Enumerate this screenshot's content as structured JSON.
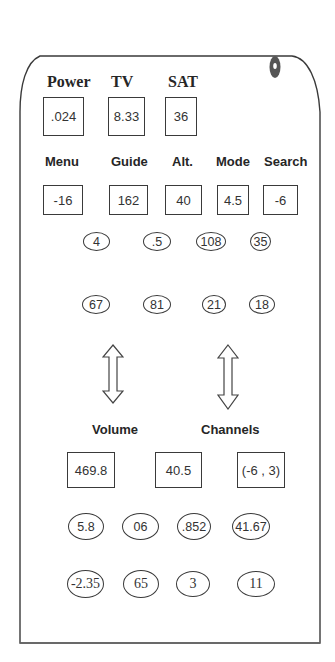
{
  "remote": {
    "top_labels": [
      "Power",
      "TV",
      "SAT"
    ],
    "top_values": [
      ".024",
      "8.33",
      "36"
    ],
    "mid_labels": [
      "Menu",
      "Guide",
      "Alt.",
      "Mode",
      "Search"
    ],
    "mid_values": [
      "-16",
      "162",
      "40",
      "4.5",
      "-6"
    ],
    "oval_row_1": [
      "4",
      ".5",
      "108",
      "35"
    ],
    "oval_row_2": [
      "67",
      "81",
      "21",
      "18"
    ],
    "arrow_labels": [
      "Volume",
      "Channels"
    ],
    "arrow_icons": [
      "up-down-arrow-icon",
      "up-down-arrow-icon"
    ],
    "bottom_values": [
      "469.8",
      "40.5",
      "(-6 , 3)"
    ],
    "oval_row_3": [
      "5.8",
      "06",
      ".852",
      "41.67"
    ],
    "oval_row_4": [
      "-2.35",
      "65",
      "3",
      "11"
    ],
    "emitter_icon": "ir-emitter-icon"
  }
}
